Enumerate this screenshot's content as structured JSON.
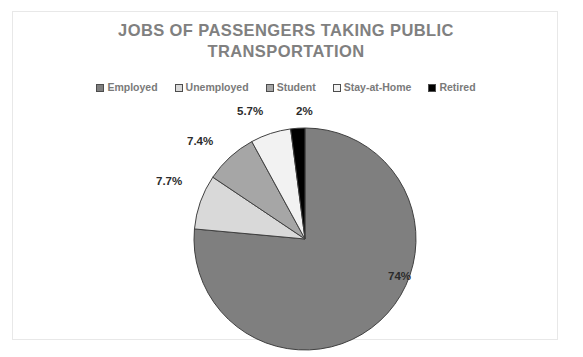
{
  "chart_data": {
    "type": "pie",
    "title": "JOBS OF PASSENGERS TAKING PUBLIC TRANSPORTATION",
    "title_line1": "JOBS OF PASSENGERS TAKING PUBLIC",
    "title_line2": "TRANSPORTATION",
    "categories": [
      "Employed",
      "Unemployed",
      "Student",
      "Stay-at-Home",
      "Retired"
    ],
    "values": [
      74,
      7.7,
      7.4,
      5.7,
      2
    ],
    "data_labels": [
      "74%",
      "7.7%",
      "7.4%",
      "5.7%",
      "2%"
    ],
    "colors": [
      "#7f7f7f",
      "#d9d9d9",
      "#a6a6a6",
      "#f2f2f2",
      "#000000"
    ],
    "slice_border_color": "#404040",
    "start_angle_deg": 0,
    "direction": "clockwise",
    "legend_position": "top",
    "grid": false,
    "xlabel": "",
    "ylabel": ""
  },
  "legend": {
    "items": [
      {
        "label": "Employed",
        "color": "#7f7f7f"
      },
      {
        "label": "Unemployed",
        "color": "#d9d9d9"
      },
      {
        "label": "Student",
        "color": "#a6a6a6"
      },
      {
        "label": "Stay-at-Home",
        "color": "#f2f2f2"
      },
      {
        "label": "Retired",
        "color": "#000000"
      }
    ]
  },
  "labels": {
    "employed": "74%",
    "unemployed": "7.7%",
    "student": "7.4%",
    "stayathome": "5.7%",
    "retired": "2%"
  },
  "style": {
    "title_color": "#808080",
    "legend_text_color": "#7a7a7a",
    "data_label_color": "#2b2b2b",
    "frame_color": "#e8e8e8",
    "background": "#ffffff"
  }
}
